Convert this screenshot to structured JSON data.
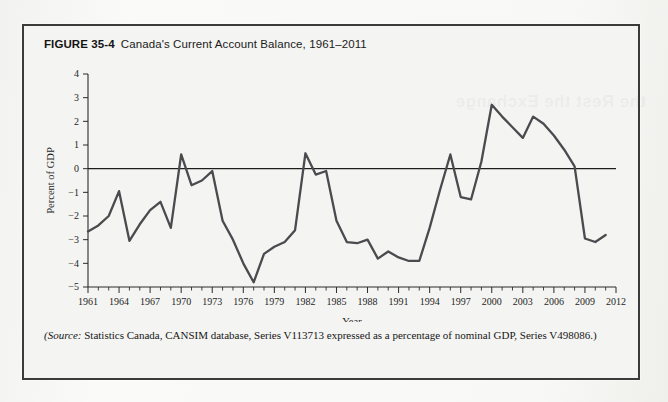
{
  "figure": {
    "number": "FIGURE 35-4",
    "caption": "Canada's Current Account Balance, 1961–2011",
    "source_prefix": "(Source:",
    "source_text": " Statistics Canada, CANSIM database, Series V113713 expressed as a percentage of nominal GDP, Series V498086.)"
  },
  "colors": {
    "page_background": "#f7f7f5",
    "figure_background": "#f4f4f2",
    "figure_border": "#3b3b3b",
    "line": "#4a4a4f",
    "axis": "#2b2b2b",
    "text": "#161616"
  },
  "chart_data": {
    "type": "line",
    "title": "Canada's Current Account Balance, 1961–2011",
    "xlabel": "Year",
    "ylabel": "Percent of GDP",
    "xlim": [
      1961,
      2012
    ],
    "ylim": [
      -5,
      4
    ],
    "ytick_labels": [
      "4",
      "3",
      "2",
      "1",
      "0",
      "−1",
      "−2",
      "−3",
      "−4",
      "−5"
    ],
    "yticks": [
      4,
      3,
      2,
      1,
      0,
      -1,
      -2,
      -3,
      -4,
      -5
    ],
    "xtick_labels": [
      "1961",
      "1964",
      "1967",
      "1970",
      "1973",
      "1976",
      "1979",
      "1982",
      "1985",
      "1988",
      "1991",
      "1994",
      "1997",
      "2000",
      "2003",
      "2006",
      "2009",
      "2012"
    ],
    "xticks": [
      1961,
      1964,
      1967,
      1970,
      1973,
      1976,
      1979,
      1982,
      1985,
      1988,
      1991,
      1994,
      1997,
      2000,
      2003,
      2006,
      2009,
      2012
    ],
    "minor_xtick_interval": 1,
    "grid": false,
    "legend": false,
    "zero_reference_line": 0,
    "series": [
      {
        "name": "Current Account Balance (% of GDP)",
        "x": [
          1961,
          1962,
          1963,
          1964,
          1965,
          1966,
          1967,
          1968,
          1969,
          1970,
          1971,
          1972,
          1973,
          1974,
          1975,
          1976,
          1977,
          1978,
          1979,
          1980,
          1981,
          1982,
          1983,
          1984,
          1985,
          1986,
          1987,
          1988,
          1989,
          1990,
          1991,
          1992,
          1993,
          1994,
          1995,
          1996,
          1997,
          1998,
          1999,
          2000,
          2001,
          2002,
          2003,
          2004,
          2005,
          2006,
          2007,
          2008,
          2009,
          2010,
          2011
        ],
        "values": [
          -2.65,
          -2.4,
          -2.0,
          -0.95,
          -3.05,
          -2.35,
          -1.75,
          -1.4,
          -2.5,
          0.6,
          -0.7,
          -0.5,
          -0.1,
          -2.2,
          -3.0,
          -4.0,
          -4.8,
          -3.6,
          -3.3,
          -3.1,
          -2.6,
          0.65,
          -0.25,
          -0.1,
          -2.2,
          -3.1,
          -3.15,
          -3.0,
          -3.8,
          -3.5,
          -3.75,
          -3.9,
          -3.9,
          -2.5,
          -0.9,
          0.6,
          -1.2,
          -1.3,
          0.3,
          2.7,
          2.2,
          1.75,
          1.3,
          2.2,
          1.9,
          1.4,
          0.8,
          0.1,
          -2.95,
          -3.1,
          -2.8
        ]
      }
    ]
  },
  "watermark": "the Rest the Exchange"
}
